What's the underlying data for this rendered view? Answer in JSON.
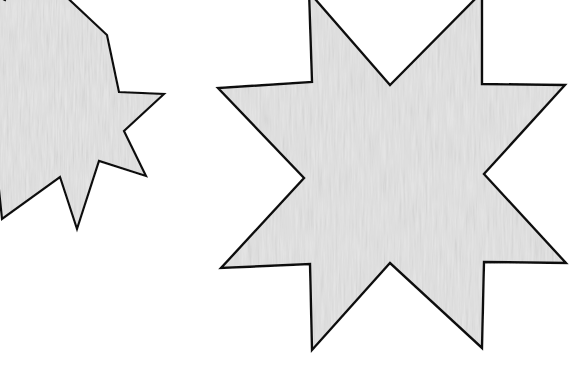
{
  "scene": {
    "title": "Two eight-pointed star polygons",
    "background_color": "#ffffff",
    "width": 570,
    "height": 365,
    "shape_count": 2
  },
  "style": {
    "fill_color": "#e6e6e6",
    "stroke_color": "#111111",
    "texture": "fine-diagonal-paper-grain",
    "texture_opacity": 0.35
  },
  "shapes": [
    {
      "name": "left-star",
      "label": "Smaller eight-pointed star (clipped at left edge)",
      "points": 8,
      "clipped": "left",
      "center": {
        "x": 40,
        "y": 150
      },
      "outer_radius": 125,
      "inner_radius": 58,
      "rotation_deg": -22,
      "fill_color": "#e6e6e6",
      "stroke_color": "#111111",
      "stroke_width": 2.2,
      "polygon": "107,35 119,92 164,94 124,131 146,176 99,161 77,229 60,177 2,219 -6,141 -66,143 -30,93 -84,51 -28,34 -42,-24 5,0 30,-55 58,-11"
    },
    {
      "name": "right-star",
      "label": "Larger eight-pointed star (top point clipped)",
      "points": 8,
      "clipped": "top",
      "center": {
        "x": 396,
        "y": 173
      },
      "outer_radius": 178,
      "inner_radius": 86,
      "rotation_deg": -20,
      "fill_color": "#e6e6e6",
      "stroke_color": "#111111",
      "stroke_width": 2.4,
      "polygon": "309,-8 312,82 218,88 304,178 221,268 310,264 312,350 390,263 482,348 484,262 566,263 484,174 565,85 482,84 482,-8 390,85"
    }
  ],
  "render_notes": {
    "outline_style": "solid black outline",
    "fill_style": "flat light gray with faint paper texture"
  }
}
